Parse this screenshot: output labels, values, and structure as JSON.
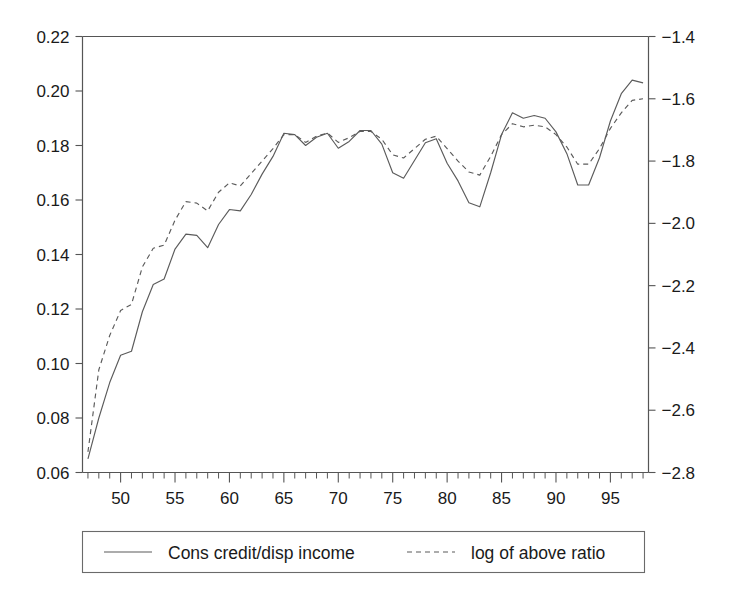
{
  "chart_data": {
    "type": "line",
    "title": "",
    "subtitle": "",
    "xlabel": "",
    "ylabel": "",
    "y2label": "",
    "grid": false,
    "legend_position": "bottom",
    "xlim": [
      46.5,
      98.5
    ],
    "xticks_major": [
      50,
      55,
      60,
      65,
      70,
      75,
      80,
      85,
      90,
      95
    ],
    "xtick_labels": [
      "50",
      "55",
      "60",
      "65",
      "70",
      "75",
      "80",
      "85",
      "90",
      "95"
    ],
    "xticks_minor_step": 1,
    "ylim": [
      0.06,
      0.22
    ],
    "yticks": [
      0.06,
      0.08,
      0.1,
      0.12,
      0.14,
      0.16,
      0.18,
      0.2,
      0.22
    ],
    "ytick_labels": [
      "0.06",
      "0.08",
      "0.10",
      "0.12",
      "0.14",
      "0.16",
      "0.18",
      "0.20",
      "0.22"
    ],
    "y2lim": [
      -2.8,
      -1.4
    ],
    "y2ticks": [
      -2.8,
      -2.6,
      -2.4,
      -2.2,
      -2.0,
      -1.8,
      -1.6,
      -1.4
    ],
    "y2tick_labels": [
      "−2.8",
      "−2.6",
      "−2.4",
      "−2.2",
      "−2.0",
      "−1.8",
      "−1.6",
      "−1.4"
    ],
    "x": [
      47,
      48,
      49,
      50,
      51,
      52,
      53,
      54,
      55,
      56,
      57,
      58,
      59,
      60,
      61,
      62,
      63,
      64,
      65,
      66,
      67,
      68,
      69,
      70,
      71,
      72,
      73,
      74,
      75,
      76,
      77,
      78,
      79,
      80,
      81,
      82,
      83,
      84,
      85,
      86,
      87,
      88,
      89,
      90,
      91,
      92,
      93,
      94,
      95,
      96,
      97,
      98
    ],
    "series": [
      {
        "name": "Cons credit/disp income",
        "style": "solid",
        "axis": "left",
        "units": "ratio",
        "values": [
          0.065,
          0.08,
          0.093,
          0.103,
          0.1045,
          0.119,
          0.129,
          0.131,
          0.142,
          0.1475,
          0.147,
          0.1425,
          0.151,
          0.1565,
          0.156,
          0.162,
          0.1695,
          0.176,
          0.1845,
          0.184,
          0.18,
          0.183,
          0.1845,
          0.179,
          0.1815,
          0.1855,
          0.1855,
          0.1805,
          0.17,
          0.168,
          0.1745,
          0.181,
          0.1825,
          0.1735,
          0.167,
          0.159,
          0.1575,
          0.17,
          0.184,
          0.192,
          0.19,
          0.191,
          0.19,
          0.185,
          0.177,
          0.1655,
          0.1655,
          0.1755,
          0.189,
          0.199,
          0.204,
          0.203
        ]
      },
      {
        "name": "log of above ratio",
        "style": "dashed",
        "axis": "right",
        "units": "log ratio",
        "values": [
          -2.734,
          -2.47,
          -2.36,
          -2.28,
          -2.26,
          -2.14,
          -2.08,
          -2.07,
          -1.99,
          -1.93,
          -1.935,
          -1.96,
          -1.9,
          -1.87,
          -1.88,
          -1.84,
          -1.8,
          -1.76,
          -1.715,
          -1.715,
          -1.74,
          -1.72,
          -1.71,
          -1.74,
          -1.725,
          -1.705,
          -1.705,
          -1.73,
          -1.78,
          -1.79,
          -1.76,
          -1.73,
          -1.72,
          -1.76,
          -1.8,
          -1.835,
          -1.845,
          -1.785,
          -1.715,
          -1.68,
          -1.69,
          -1.685,
          -1.69,
          -1.715,
          -1.755,
          -1.81,
          -1.81,
          -1.76,
          -1.695,
          -1.645,
          -1.605,
          -1.6
        ]
      }
    ]
  },
  "legend": {
    "items": [
      {
        "label": "Cons credit/disp income",
        "style": "solid"
      },
      {
        "label": "log of above ratio",
        "style": "dashed"
      }
    ]
  }
}
